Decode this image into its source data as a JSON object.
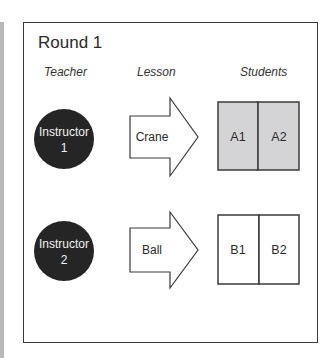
{
  "title": "Round 1",
  "columns": {
    "teacher": "Teacher",
    "lesson": "Lesson",
    "students": "Students"
  },
  "rows": [
    {
      "teacher_line1": "Instructor",
      "teacher_line2": "1",
      "lesson": "Crane",
      "students": [
        "A1",
        "A2"
      ],
      "students_fill": "#d4d4d6"
    },
    {
      "teacher_line1": "Instructor",
      "teacher_line2": "2",
      "lesson": "Ball",
      "students": [
        "B1",
        "B2"
      ],
      "students_fill": "#ffffff"
    }
  ],
  "colors": {
    "circle": "#252525",
    "stroke": "#3a3a3a",
    "side_bar": "#b9b9bc"
  }
}
